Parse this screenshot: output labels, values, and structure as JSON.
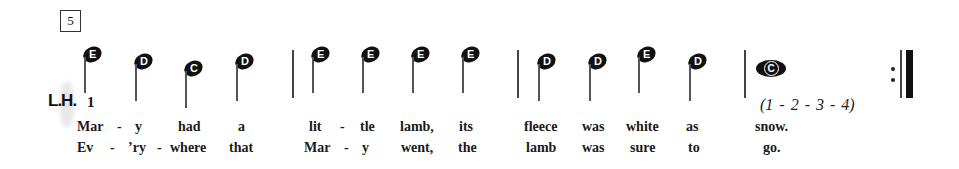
{
  "measure_number": "5",
  "hand_label": "L.H.",
  "finger_number": "1",
  "count_text": "(1 - 2 - 3 - 4)",
  "notes": [
    {
      "name": "E",
      "measure": 1
    },
    {
      "name": "D",
      "measure": 1
    },
    {
      "name": "C",
      "measure": 1
    },
    {
      "name": "D",
      "measure": 1
    },
    {
      "name": "E",
      "measure": 2
    },
    {
      "name": "E",
      "measure": 2
    },
    {
      "name": "E",
      "measure": 2
    },
    {
      "name": "E",
      "measure": 2
    },
    {
      "name": "D",
      "measure": 3
    },
    {
      "name": "D",
      "measure": 3
    },
    {
      "name": "E",
      "measure": 3
    },
    {
      "name": "D",
      "measure": 3
    },
    {
      "name": "C",
      "measure": 4,
      "type": "whole"
    }
  ],
  "lyrics": {
    "verse1": [
      "Mar",
      "-",
      "y",
      "had",
      "a",
      "lit",
      "-",
      "tle",
      "lamb,",
      "its",
      "fleece",
      "was",
      "white",
      "as",
      "snow."
    ],
    "verse2": [
      "Ev",
      "-",
      "’ry",
      "-",
      "where",
      "that",
      "Mar",
      "-",
      "y",
      "went,",
      "the",
      "lamb",
      "was",
      "sure",
      "to",
      "go."
    ]
  },
  "end_marker": "repeat-end"
}
